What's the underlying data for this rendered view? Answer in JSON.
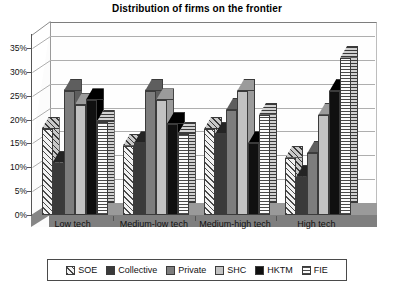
{
  "chart_data": {
    "type": "bar",
    "title": "Distribution of firms on the frontier",
    "xlabel": "",
    "ylabel": "",
    "ylim": [
      0,
      35
    ],
    "ytick_labels": [
      "0%",
      "5%",
      "10%",
      "15%",
      "20%",
      "25%",
      "30%",
      "35%"
    ],
    "ytick_values": [
      0,
      5,
      10,
      15,
      20,
      25,
      30,
      35
    ],
    "grid": true,
    "legend_position": "bottom",
    "three_d": true,
    "categories": [
      "Low tech",
      "Medium-low tech",
      "Medium-high tech",
      "High tech"
    ],
    "series": [
      {
        "name": "SOE",
        "pattern": "diagonal-hatch",
        "color": "#f2f2f2",
        "values": [
          18,
          14.5,
          18,
          12
        ]
      },
      {
        "name": "Collective",
        "pattern": "solid-dark-gray",
        "color": "#3a3a3a",
        "values": [
          11,
          15,
          17,
          8
        ]
      },
      {
        "name": "Private",
        "pattern": "solid-mid-gray",
        "color": "#7d7d7d",
        "values": [
          26,
          26,
          22,
          13
        ]
      },
      {
        "name": "SHC",
        "pattern": "solid-light-gray",
        "color": "#c2c2c2",
        "values": [
          23,
          24,
          26,
          21
        ]
      },
      {
        "name": "HKTM",
        "pattern": "solid-black",
        "color": "#101010",
        "values": [
          24,
          19,
          15,
          26
        ]
      },
      {
        "name": "FIE",
        "pattern": "horizontal-lines",
        "color": "#fbfbfb",
        "values": [
          19.5,
          17,
          21,
          33
        ]
      }
    ]
  },
  "legend": {
    "items": [
      {
        "label": "SOE"
      },
      {
        "label": "Collective"
      },
      {
        "label": "Private"
      },
      {
        "label": "SHC"
      },
      {
        "label": "HKTM"
      },
      {
        "label": "FIE"
      }
    ]
  }
}
